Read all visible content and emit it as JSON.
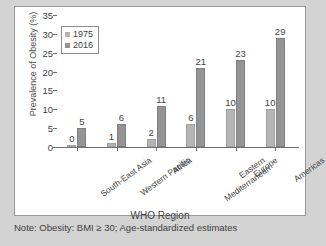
{
  "chart_data": {
    "type": "bar",
    "title": "",
    "xlabel": "WHO Region",
    "ylabel": "Prevalence of Obesity (%)",
    "categories": [
      "South-East Asia",
      "Western Pacific",
      "Africa",
      "Eastern Mediterranean",
      "Europe",
      "Americas"
    ],
    "category_lines": [
      [
        "South-East Asia"
      ],
      [
        "Western Pacific"
      ],
      [
        "Africa"
      ],
      [
        "Eastern",
        "Mediterranean"
      ],
      [
        "Europe"
      ],
      [
        "Americas"
      ]
    ],
    "series": [
      {
        "name": "1975",
        "color": "#b5b5b5",
        "values": [
          0,
          1,
          2,
          6,
          10,
          10
        ]
      },
      {
        "name": "2016",
        "color": "#949494",
        "values": [
          5,
          6,
          11,
          21,
          23,
          29
        ]
      }
    ],
    "ylim": [
      0,
      35
    ],
    "yticks": [
      0,
      5,
      10,
      15,
      20,
      25,
      30,
      35
    ],
    "ytick_labels": [
      "0",
      "5",
      "10",
      "15",
      "20",
      "25",
      "30",
      "35"
    ],
    "grid": false,
    "legend_position": "top-left",
    "data_labels": true
  },
  "legend": {
    "entries": [
      {
        "label": "1975"
      },
      {
        "label": "2016"
      }
    ]
  },
  "note": "Note: Obesity: BMI ≥ 30; Age-standardized estimates"
}
